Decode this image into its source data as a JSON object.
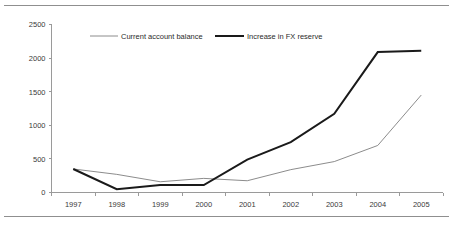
{
  "chart_data": {
    "type": "line",
    "title": "",
    "subtitle": "",
    "xlabel": "",
    "ylabel": "",
    "categories": [
      "1997",
      "1998",
      "1999",
      "2000",
      "2001",
      "2002",
      "2003",
      "2004",
      "2005"
    ],
    "x": [
      1997,
      1998,
      1999,
      2000,
      2001,
      2002,
      2003,
      2004,
      2005
    ],
    "ylim": [
      0,
      2500
    ],
    "yticks": [
      0,
      500,
      1000,
      1500,
      2000,
      2500
    ],
    "ytick_labels": [
      "0",
      "500",
      "1000",
      "1500",
      "2000",
      "2500"
    ],
    "grid": false,
    "legend_position": "top-center",
    "series": [
      {
        "name": "Current account balance",
        "color": "#8c8c8c",
        "line_width": 1,
        "values": [
          350,
          270,
          160,
          210,
          175,
          340,
          460,
          700,
          1450
        ]
      },
      {
        "name": "Increase in FX reserve",
        "color": "#1a1a1a",
        "line_width": 2,
        "values": [
          350,
          50,
          110,
          110,
          490,
          750,
          1170,
          2090,
          2110
        ]
      }
    ]
  },
  "legend": {
    "items": [
      {
        "label": "Current account balance"
      },
      {
        "label": "Increase in FX reserve"
      }
    ]
  },
  "axes": {
    "y_tick_labels": [
      "2500",
      "2000",
      "1500",
      "1000",
      "500",
      "0"
    ],
    "x_tick_labels": [
      "1997",
      "1998",
      "1999",
      "2000",
      "2001",
      "2002",
      "2003",
      "2004",
      "2005"
    ]
  },
  "colors": {
    "series_current_account": "#8c8c8c",
    "series_fx_reserve": "#1a1a1a",
    "axis": "#9a9a9a",
    "rule": "#8f8f8f",
    "text": "#3a3a3a",
    "background": "#ffffff"
  }
}
